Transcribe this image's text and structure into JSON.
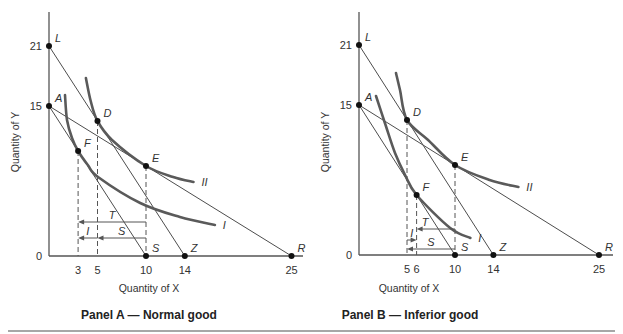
{
  "chart_data": [
    {
      "type": "line",
      "title": "Panel A — Normal good",
      "xlabel": "Quantity of X",
      "ylabel": "Quantity of Y",
      "origin_label": "0",
      "grid": false,
      "x_ticks": [
        3,
        5,
        10,
        14,
        25
      ],
      "y_ticks": [
        15,
        21
      ],
      "budget_lines": [
        {
          "name": "LZ",
          "from": [
            0,
            21
          ],
          "to": [
            14,
            0
          ]
        },
        {
          "name": "AR",
          "from": [
            0,
            15
          ],
          "to": [
            25,
            0
          ]
        },
        {
          "name": "AS",
          "from": [
            0,
            15
          ],
          "to": [
            10,
            0
          ]
        }
      ],
      "indifference_curves": [
        {
          "label": "II",
          "points": [
            [
              3.8,
              17.8
            ],
            [
              4.3,
              15.5
            ],
            [
              5,
              13.5
            ],
            [
              6.5,
              11.6
            ],
            [
              10,
              9
            ],
            [
              12.8,
              7.9
            ],
            [
              14.9,
              7.4
            ]
          ]
        },
        {
          "label": "I",
          "points": [
            [
              1.65,
              16.1
            ],
            [
              1.86,
              13.6
            ],
            [
              2.37,
              11.8
            ],
            [
              3,
              10.5
            ],
            [
              4.0,
              9.1
            ],
            [
              5.05,
              7.9
            ],
            [
              9.4,
              5.3
            ],
            [
              13.5,
              3.9
            ],
            [
              17.1,
              3.1
            ]
          ]
        }
      ],
      "points": [
        {
          "label": "L",
          "x": 0,
          "y": 21
        },
        {
          "label": "A",
          "x": 0,
          "y": 15
        },
        {
          "label": "D",
          "x": 5,
          "y": 13.5
        },
        {
          "label": "E",
          "x": 10,
          "y": 9
        },
        {
          "label": "F",
          "x": 3,
          "y": 10.5
        },
        {
          "label": "S",
          "x": 10,
          "y": 0
        },
        {
          "label": "Z",
          "x": 14,
          "y": 0
        },
        {
          "label": "R",
          "x": 25,
          "y": 0
        }
      ],
      "drop_lines": [
        {
          "x": 3,
          "y": 10.5
        },
        {
          "x": 5,
          "y": 13.5
        },
        {
          "x": 10,
          "y": 9
        }
      ],
      "effects": [
        {
          "label": "T",
          "from": 10,
          "to": 3,
          "y": 3.4
        },
        {
          "label": "S",
          "from": 10,
          "to": 5,
          "y": 1.8
        },
        {
          "label": "I",
          "from": 5,
          "to": 3,
          "y": 1.8
        }
      ]
    },
    {
      "type": "line",
      "title": "Panel B — Inferior good",
      "xlabel": "Quantity of X",
      "ylabel": "Quantity of Y",
      "origin_label": "0",
      "grid": false,
      "x_ticks": [
        5,
        6,
        10,
        14,
        25
      ],
      "y_ticks": [
        15,
        21
      ],
      "budget_lines": [
        {
          "name": "LZ",
          "from": [
            0,
            21
          ],
          "to": [
            14,
            0
          ]
        },
        {
          "name": "AR",
          "from": [
            0,
            15
          ],
          "to": [
            25,
            0
          ]
        },
        {
          "name": "AS",
          "from": [
            0,
            15
          ],
          "to": [
            10,
            0
          ]
        }
      ],
      "indifference_curves": [
        {
          "label": "II",
          "points": [
            [
              3.85,
              18.2
            ],
            [
              4.27,
              16.5
            ],
            [
              5,
              13.5
            ],
            [
              7.2,
              11.5
            ],
            [
              10,
              9
            ],
            [
              13.6,
              7.5
            ],
            [
              16.6,
              6.8
            ]
          ]
        },
        {
          "label": "I",
          "points": [
            [
              1.77,
              15.9
            ],
            [
              2.7,
              13.2
            ],
            [
              3.75,
              10.2
            ],
            [
              4.8,
              8.0
            ],
            [
              6,
              6
            ],
            [
              9.5,
              2.7
            ],
            [
              11.6,
              1.7
            ]
          ]
        }
      ],
      "points": [
        {
          "label": "L",
          "x": 0,
          "y": 21
        },
        {
          "label": "A",
          "x": 0,
          "y": 15
        },
        {
          "label": "D",
          "x": 5,
          "y": 13.5
        },
        {
          "label": "E",
          "x": 10,
          "y": 9
        },
        {
          "label": "F",
          "x": 6,
          "y": 6
        },
        {
          "label": "S",
          "x": 10,
          "y": 0
        },
        {
          "label": "Z",
          "x": 14,
          "y": 0
        },
        {
          "label": "R",
          "x": 25,
          "y": 0
        }
      ],
      "drop_lines": [
        {
          "x": 5,
          "y": 13.5
        },
        {
          "x": 6,
          "y": 6
        },
        {
          "x": 10,
          "y": 9
        }
      ],
      "effects": [
        {
          "label": "T",
          "from": 10,
          "to": 6,
          "y": 2.6,
          "label_x": 6.9
        },
        {
          "label": "I",
          "from": 5,
          "to": 6,
          "y": 1.5
        },
        {
          "label": "S",
          "from": 10,
          "to": 5,
          "y": 0.6
        }
      ]
    }
  ]
}
